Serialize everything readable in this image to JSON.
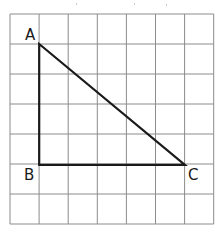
{
  "figure": {
    "background_color": "#ffffff",
    "grid": {
      "origin_x": 10,
      "origin_y": 14,
      "cell_width": 29.1,
      "cell_height": 30,
      "columns": 7,
      "rows": 7,
      "line_color": "#8c8c8c",
      "line_width": 1,
      "border_color": "#8c8c8c",
      "border_width": 1
    },
    "shape": {
      "name": "triangle",
      "stroke_color": "#1a1a1a",
      "stroke_width": 2.2,
      "fill": "none",
      "vertices": [
        {
          "label": "A",
          "x": 39.2,
          "y": 44,
          "grid_col": 1,
          "grid_row": 1,
          "label_x": 25,
          "label_y": 40,
          "label_anchor": "start"
        },
        {
          "label": "B",
          "x": 39.2,
          "y": 164.8,
          "grid_col": 1,
          "grid_row": 5,
          "label_x": 24,
          "label_y": 180,
          "label_anchor": "start"
        },
        {
          "label": "C",
          "x": 184.9,
          "y": 164.8,
          "grid_col": 6,
          "grid_row": 5,
          "label_x": 188,
          "label_y": 180,
          "label_anchor": "start"
        }
      ],
      "sides": [
        {
          "name": "AB",
          "from": "A",
          "to": "B",
          "orientation": "vertical",
          "length_cells": 4
        },
        {
          "name": "BC",
          "from": "B",
          "to": "C",
          "orientation": "horizontal",
          "length_cells": 5
        },
        {
          "name": "CA",
          "from": "C",
          "to": "A",
          "orientation": "diagonal",
          "is_hypotenuse": true
        }
      ],
      "right_angle_at": "B"
    },
    "artifacts": [
      {
        "x": 76,
        "y": 3
      },
      {
        "x": 134,
        "y": 3
      },
      {
        "x": 166,
        "y": 4
      }
    ]
  }
}
